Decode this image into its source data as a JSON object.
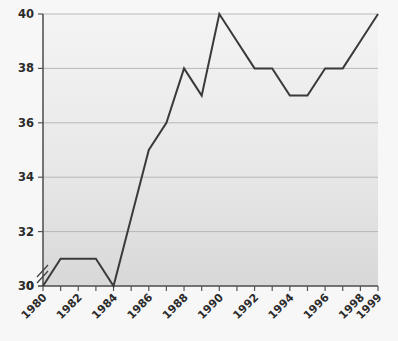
{
  "chart_data": {
    "type": "line",
    "title": "",
    "subtitle": "",
    "xlabel": "",
    "ylabel": "",
    "x": [
      1980,
      1981,
      1982,
      1983,
      1984,
      1985,
      1986,
      1987,
      1988,
      1989,
      1990,
      1991,
      1992,
      1993,
      1994,
      1995,
      1996,
      1997,
      1998,
      1999
    ],
    "values": [
      30,
      31,
      31,
      31,
      30,
      32.5,
      35,
      36,
      38,
      37,
      40,
      39,
      38,
      38,
      37,
      37,
      38,
      38,
      39,
      40
    ],
    "series": [
      {
        "name": "series-1",
        "values": [
          30,
          31,
          31,
          31,
          30,
          32.5,
          35,
          36,
          38,
          37,
          40,
          39,
          38,
          38,
          37,
          37,
          38,
          38,
          39,
          40
        ]
      }
    ],
    "categories": [
      "1980",
      "1981",
      "1982",
      "1983",
      "1984",
      "1985",
      "1986",
      "1987",
      "1988",
      "1989",
      "1990",
      "1991",
      "1992",
      "1993",
      "1994",
      "1995",
      "1996",
      "1997",
      "1998",
      "1999"
    ],
    "xlim": [
      1980,
      1999
    ],
    "ylim": [
      30,
      40
    ],
    "y_axis_broken": true,
    "y_break_from": 0,
    "y_break_to": 30,
    "ytick_values": [
      0,
      30,
      32,
      34,
      36,
      38,
      40
    ],
    "ytick_labels": [
      "0",
      "30",
      "32",
      "34",
      "36",
      "38",
      "40"
    ],
    "xtick_labels_shown": [
      "1980",
      "1982",
      "1984",
      "1986",
      "1988",
      "1990",
      "1992",
      "1994",
      "1996",
      "1998",
      "1999"
    ],
    "xtick_all": [
      "1980",
      "1981",
      "1982",
      "1983",
      "1984",
      "1985",
      "1986",
      "1987",
      "1988",
      "1989",
      "1990",
      "1991",
      "1992",
      "1993",
      "1994",
      "1995",
      "1996",
      "1997",
      "1998",
      "1999"
    ],
    "grid": true,
    "grid_axis": "y",
    "legend": false,
    "legend_position": "none",
    "annotations": [],
    "colors": {
      "line": "#3a3a3a",
      "grid": "#a9a9a9",
      "axis": "#555555",
      "plot_background_top": "#f2f2f2",
      "plot_background_bottom": "#d9d9d9",
      "page_background": "#f7f7f7",
      "tick_text": "#2b2b2b"
    }
  }
}
